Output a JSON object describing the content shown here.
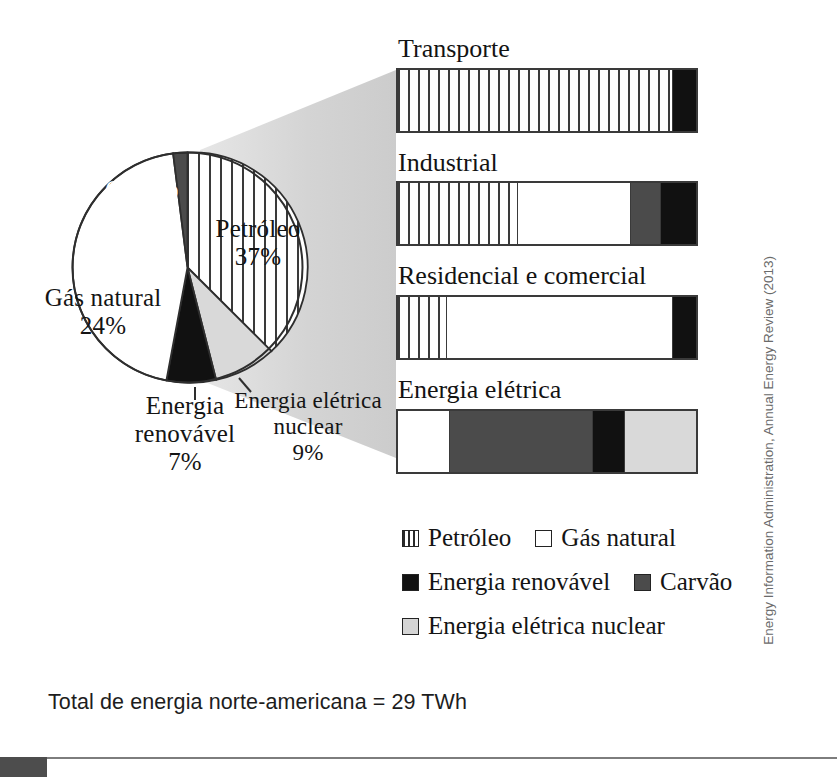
{
  "chart_data": [
    {
      "type": "pie",
      "title": "",
      "labels": [
        "Petróleo",
        "Energia elétrica nuclear",
        "Energia renovável",
        "Gás natural",
        "Carvão"
      ],
      "values": [
        37,
        9,
        7,
        24,
        23
      ],
      "unit": "%",
      "start_angle_deg": 0,
      "direction": "clockwise",
      "colors": {
        "Petróleo": "#ffffff-striped",
        "Gás natural": "#ffffff",
        "Energia renovável": "#111111",
        "Carvão": "#4b4b4b",
        "Energia elétrica nuclear": "#d9d9d9"
      },
      "annotations": [
        {
          "label": "Carvão",
          "value_text": "23%"
        },
        {
          "label": "Gás natural",
          "value_text": "24%"
        },
        {
          "label": "Petróleo",
          "value_text": "37%"
        },
        {
          "label": "Energia renovável",
          "value_text": "7%"
        },
        {
          "label": "Energia elétrica nuclear",
          "value_text": "9%"
        }
      ]
    },
    {
      "type": "bar",
      "orientation": "horizontal",
      "stacked": true,
      "categories": [
        "Transporte",
        "Industrial",
        "Residencial e comercial",
        "Energia elétrica"
      ],
      "series": [
        {
          "name": "Petróleo",
          "values": [
            92,
            40,
            16,
            0
          ]
        },
        {
          "name": "Gás natural",
          "values": [
            0,
            38,
            76,
            17
          ]
        },
        {
          "name": "Carvão",
          "values": [
            0,
            10,
            0,
            48
          ]
        },
        {
          "name": "Energia renovável",
          "values": [
            8,
            12,
            8,
            11
          ]
        },
        {
          "name": "Energia elétrica nuclear",
          "values": [
            0,
            0,
            0,
            24
          ]
        }
      ],
      "xlabel": "",
      "ylabel": "",
      "xlim": [
        0,
        100
      ],
      "grid": false,
      "legend_position": "bottom"
    }
  ],
  "pie": {
    "slices": [
      {
        "key": "petroleo",
        "label": "Petróleo",
        "pct_text": "37%",
        "value": 37,
        "fill": "petroleo"
      },
      {
        "key": "nuclear",
        "label": "Energia elétrica nuclear",
        "pct_text": "9%",
        "value": 9,
        "fill": "nuclear"
      },
      {
        "key": "renovavel",
        "label": "Energia renovável",
        "pct_text": "7%",
        "value": 7,
        "fill": "renovavel"
      },
      {
        "key": "gas",
        "label": "Gás natural",
        "pct_text": "24%",
        "value": 24,
        "fill": "gas"
      },
      {
        "key": "carvao",
        "label": "Carvão",
        "pct_text": "23%",
        "value": 23,
        "fill": "carvao"
      }
    ],
    "labels": {
      "carvao_name": "Carvão",
      "carvao_pct": "23%",
      "gas_name": "Gás natural",
      "gas_pct": "24%",
      "petroleo_name": "Petróleo",
      "petroleo_pct": "37%",
      "renovavel_name": "Energia",
      "renovavel_name2": "renovável",
      "renovavel_pct": "7%",
      "nuclear_name": "Energia elétrica",
      "nuclear_name2": "nuclear",
      "nuclear_pct": "9%"
    }
  },
  "bars": [
    {
      "title": "Transporte",
      "segments": [
        {
          "type": "petroleo",
          "pct": 92
        },
        {
          "type": "renovavel",
          "pct": 8
        }
      ]
    },
    {
      "title": "Industrial",
      "segments": [
        {
          "type": "petroleo",
          "pct": 40
        },
        {
          "type": "gas",
          "pct": 38
        },
        {
          "type": "carvao",
          "pct": 10
        },
        {
          "type": "renovavel",
          "pct": 12
        }
      ]
    },
    {
      "title": "Residencial e comercial",
      "segments": [
        {
          "type": "petroleo",
          "pct": 16
        },
        {
          "type": "gas",
          "pct": 76
        },
        {
          "type": "renovavel",
          "pct": 8
        }
      ]
    },
    {
      "title": "Energia elétrica",
      "segments": [
        {
          "type": "gas",
          "pct": 17
        },
        {
          "type": "carvao",
          "pct": 48
        },
        {
          "type": "renovavel",
          "pct": 11
        },
        {
          "type": "nuclear",
          "pct": 24
        }
      ]
    }
  ],
  "legend": {
    "rows": [
      [
        {
          "swatch": "petroleo",
          "label": "Petróleo"
        },
        {
          "swatch": "gas",
          "label": "Gás natural"
        }
      ],
      [
        {
          "swatch": "renovavel",
          "label": "Energia renovável"
        },
        {
          "swatch": "carvao",
          "label": "Carvão"
        }
      ],
      [
        {
          "swatch": "nuclear",
          "label": "Energia elétrica nuclear"
        }
      ]
    ]
  },
  "total_text": "Total de energia norte-americana = 29 TWh",
  "credit_text": "Energy Information Administration, Annual Energy Review (2013)",
  "colors": {
    "petroleo_stripe": "#3a3a3a",
    "gas": "#ffffff",
    "renovavel": "#111111",
    "carvao": "#4b4b4b",
    "nuclear": "#d9d9d9",
    "funnel": "#d2d2d2",
    "outline": "#3a3a3a"
  }
}
